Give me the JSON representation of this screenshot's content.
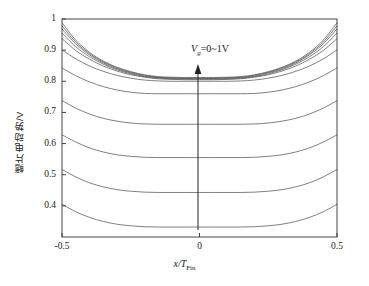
{
  "chart_data": {
    "type": "line",
    "title": "",
    "xlabel": "x/T_Fin",
    "xlabel_main": "x/T",
    "xlabel_sub": "Fin",
    "ylabel": "鳍片电动势/V",
    "xlim": [
      -0.5,
      0.5
    ],
    "ylim": [
      0.3,
      1.0
    ],
    "grid": false,
    "legend": null,
    "annotation": {
      "text": "Vg=0~1V",
      "symbol": "V",
      "subscript": "g",
      "rest": "=0~1V",
      "arrow": "up",
      "arrow_meaning": "increasing gate voltage"
    },
    "x_ticks": [
      {
        "value": -0.5,
        "label": "-0.5"
      },
      {
        "value": 0,
        "label": "0"
      },
      {
        "value": 0.5,
        "label": "0.5"
      }
    ],
    "y_ticks": [
      {
        "value": 0.4,
        "label": "0.4"
      },
      {
        "value": 0.5,
        "label": "0.5"
      },
      {
        "value": 0.6,
        "label": "0.6"
      },
      {
        "value": 0.7,
        "label": "0.7"
      },
      {
        "value": 0.8,
        "label": "0.8"
      },
      {
        "value": 0.9,
        "label": "0.9"
      },
      {
        "value": 1.0,
        "label": "1"
      }
    ],
    "x": [
      -0.5,
      -0.45,
      -0.4,
      -0.35,
      -0.3,
      -0.25,
      -0.2,
      -0.15,
      -0.1,
      -0.05,
      0,
      0.05,
      0.1,
      0.15,
      0.2,
      0.25,
      0.3,
      0.35,
      0.4,
      0.45,
      0.5
    ],
    "series": [
      {
        "name": "Vg=0V",
        "edge": 0.405,
        "min": 0.332,
        "values": [
          0.405,
          0.381,
          0.363,
          0.35,
          0.341,
          0.336,
          0.333,
          0.332,
          0.332,
          0.332,
          0.332,
          0.332,
          0.332,
          0.332,
          0.333,
          0.336,
          0.341,
          0.35,
          0.363,
          0.381,
          0.405
        ]
      },
      {
        "name": "Vg=0.1V",
        "edge": 0.517,
        "min": 0.443,
        "values": [
          0.517,
          0.493,
          0.474,
          0.461,
          0.452,
          0.447,
          0.444,
          0.443,
          0.443,
          0.443,
          0.443,
          0.443,
          0.443,
          0.443,
          0.444,
          0.447,
          0.452,
          0.461,
          0.474,
          0.493,
          0.517
        ]
      },
      {
        "name": "Vg=0.2V",
        "edge": 0.628,
        "min": 0.555,
        "values": [
          0.628,
          0.605,
          0.586,
          0.573,
          0.564,
          0.559,
          0.556,
          0.555,
          0.555,
          0.555,
          0.555,
          0.555,
          0.555,
          0.555,
          0.556,
          0.559,
          0.564,
          0.573,
          0.586,
          0.605,
          0.628
        ]
      },
      {
        "name": "Vg=0.3V",
        "edge": 0.738,
        "min": 0.662,
        "values": [
          0.738,
          0.714,
          0.695,
          0.681,
          0.672,
          0.666,
          0.663,
          0.662,
          0.662,
          0.662,
          0.662,
          0.662,
          0.662,
          0.662,
          0.663,
          0.666,
          0.672,
          0.681,
          0.695,
          0.714,
          0.738
        ]
      },
      {
        "name": "Vg=0.4V",
        "edge": 0.843,
        "min": 0.76,
        "values": [
          0.843,
          0.818,
          0.798,
          0.783,
          0.772,
          0.765,
          0.761,
          0.76,
          0.76,
          0.76,
          0.76,
          0.76,
          0.76,
          0.76,
          0.761,
          0.765,
          0.772,
          0.783,
          0.798,
          0.818,
          0.843
        ]
      },
      {
        "name": "Vg=0.5V",
        "edge": 0.901,
        "min": 0.8,
        "values": [
          0.901,
          0.872,
          0.849,
          0.832,
          0.819,
          0.81,
          0.804,
          0.801,
          0.8,
          0.8,
          0.8,
          0.8,
          0.8,
          0.801,
          0.804,
          0.81,
          0.819,
          0.832,
          0.849,
          0.872,
          0.901
        ]
      },
      {
        "name": "Vg=0.6V",
        "edge": 0.937,
        "min": 0.805,
        "values": [
          0.937,
          0.899,
          0.871,
          0.849,
          0.833,
          0.821,
          0.813,
          0.808,
          0.806,
          0.805,
          0.805,
          0.805,
          0.806,
          0.808,
          0.813,
          0.821,
          0.833,
          0.849,
          0.871,
          0.899,
          0.937
        ]
      },
      {
        "name": "Vg=0.7V",
        "edge": 0.955,
        "min": 0.807,
        "values": [
          0.955,
          0.911,
          0.879,
          0.855,
          0.837,
          0.824,
          0.815,
          0.81,
          0.808,
          0.807,
          0.807,
          0.807,
          0.808,
          0.81,
          0.815,
          0.824,
          0.837,
          0.855,
          0.879,
          0.911,
          0.955
        ]
      },
      {
        "name": "Vg=0.8V",
        "edge": 0.968,
        "min": 0.809,
        "values": [
          0.968,
          0.92,
          0.885,
          0.859,
          0.84,
          0.827,
          0.817,
          0.812,
          0.81,
          0.809,
          0.809,
          0.809,
          0.81,
          0.812,
          0.817,
          0.827,
          0.84,
          0.859,
          0.885,
          0.92,
          0.968
        ]
      },
      {
        "name": "Vg=0.9V",
        "edge": 0.978,
        "min": 0.81,
        "values": [
          0.978,
          0.926,
          0.889,
          0.862,
          0.843,
          0.829,
          0.819,
          0.813,
          0.811,
          0.81,
          0.81,
          0.81,
          0.811,
          0.813,
          0.819,
          0.829,
          0.843,
          0.862,
          0.889,
          0.926,
          0.978
        ]
      },
      {
        "name": "Vg=1.0V",
        "edge": 0.988,
        "min": 0.812,
        "values": [
          0.988,
          0.932,
          0.893,
          0.865,
          0.845,
          0.831,
          0.821,
          0.815,
          0.813,
          0.812,
          0.812,
          0.812,
          0.813,
          0.815,
          0.821,
          0.831,
          0.845,
          0.865,
          0.893,
          0.932,
          0.988
        ]
      }
    ],
    "colors": {
      "curve": "#555555",
      "axis": "#333333",
      "text": "#1a1a1a",
      "background": "#ffffff"
    }
  }
}
